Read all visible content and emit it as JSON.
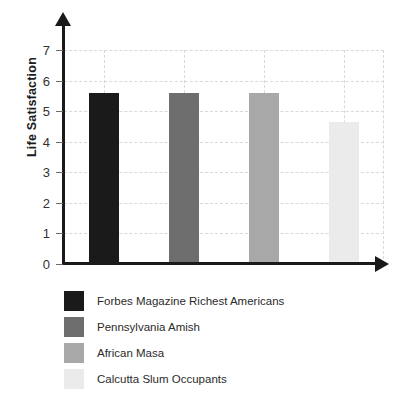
{
  "chart_data": {
    "type": "bar",
    "title": "",
    "xlabel": "",
    "ylabel": "Life Satisfaction",
    "ylim": [
      0,
      7
    ],
    "yticks": [
      0,
      1,
      2,
      3,
      4,
      5,
      6,
      7
    ],
    "ytick_labels": [
      "0",
      "1",
      "2",
      "3",
      "4",
      "5",
      "6",
      "7"
    ],
    "grid": "dashed both axes, light gray",
    "legend_position": "below plot, left aligned",
    "categories": [
      "Forbes Magazine Richest Americans",
      "Pennsylvania Amish",
      "African Masa",
      "Calcutta Slum Occupants"
    ],
    "values": [
      5.6,
      5.6,
      5.6,
      4.65
    ],
    "colors": [
      "#1a1a1a",
      "#6e6e6e",
      "#a8a8a8",
      "#ebebeb"
    ]
  },
  "legend": {
    "items": [
      {
        "label": "Forbes Magazine Richest Americans",
        "color": "#1a1a1a"
      },
      {
        "label": "Pennsylvania Amish",
        "color": "#6e6e6e"
      },
      {
        "label": "African Masa",
        "color": "#a8a8a8"
      },
      {
        "label": "Calcutta Slum Occupants",
        "color": "#ebebeb"
      }
    ]
  },
  "colors": {
    "axis": "#1a1a1a",
    "grid": "#d9d9d9",
    "tick_label": "#333333",
    "background": "#ffffff"
  }
}
